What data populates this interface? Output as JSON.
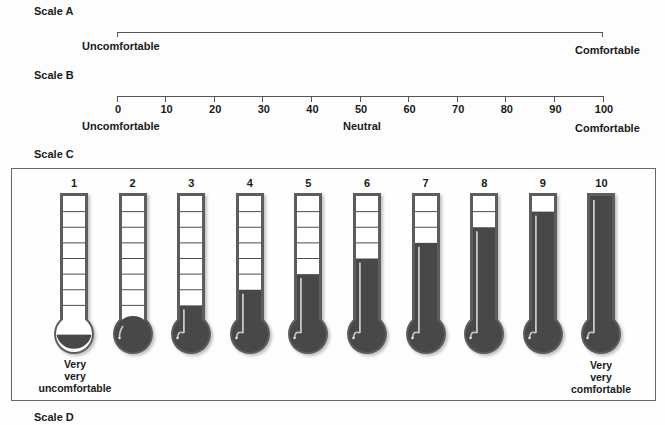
{
  "scale_a": {
    "title": "Scale A",
    "left_label": "Uncomfortable",
    "right_label": "Comfortable"
  },
  "scale_b": {
    "title": "Scale B",
    "ticks": [
      "0",
      "10",
      "20",
      "30",
      "40",
      "50",
      "60",
      "70",
      "80",
      "90",
      "100"
    ],
    "left_label": "Uncomfortable",
    "center_label": "Neutral",
    "right_label": "Comfortable"
  },
  "scale_c": {
    "title": "Scale C",
    "thermometers": [
      {
        "label": "1",
        "filled_cells": 0,
        "bulb": "half"
      },
      {
        "label": "2",
        "filled_cells": 0,
        "bulb": "full"
      },
      {
        "label": "3",
        "filled_cells": 1,
        "bulb": "full"
      },
      {
        "label": "4",
        "filled_cells": 2,
        "bulb": "full"
      },
      {
        "label": "5",
        "filled_cells": 3,
        "bulb": "full"
      },
      {
        "label": "6",
        "filled_cells": 4,
        "bulb": "full"
      },
      {
        "label": "7",
        "filled_cells": 5,
        "bulb": "full"
      },
      {
        "label": "8",
        "filled_cells": 6,
        "bulb": "full"
      },
      {
        "label": "9",
        "filled_cells": 7,
        "bulb": "full"
      },
      {
        "label": "10",
        "filled_cells": 8,
        "bulb": "full"
      }
    ],
    "total_cells": 8,
    "left_caption": [
      "Very",
      "very",
      "uncomfortable"
    ],
    "right_caption": [
      "Very",
      "very",
      "comfortable"
    ],
    "colors": {
      "fill": "#4a4747",
      "frame": "#5e5b5b",
      "cell_border": "#4d4d4d",
      "empty": "#ffffff",
      "highlight": "#c9c6c6"
    }
  },
  "scale_d": {
    "title": "Scale D"
  }
}
